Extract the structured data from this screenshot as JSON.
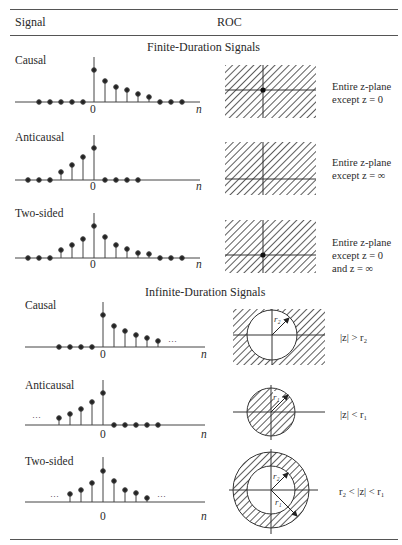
{
  "header": {
    "col_signal": "Signal",
    "col_roc": "ROC"
  },
  "sections": [
    {
      "title": "Finite-Duration Signals",
      "rows": [
        {
          "label": "Causal",
          "roc_lines": [
            "Entire z-plane",
            "except z = 0"
          ],
          "roc_type": "plane-except-origin",
          "samples": {
            "n": [
              -5,
              -4,
              -3,
              -2,
              -1,
              0,
              1,
              2,
              3,
              4,
              5,
              6,
              7,
              8
            ],
            "x": [
              0,
              0,
              0,
              0,
              0,
              1.0,
              0.67,
              0.53,
              0.41,
              0.33,
              0.24,
              0,
              0,
              0
            ]
          }
        },
        {
          "label": "Anticausal",
          "roc_lines": [
            "Entire z-plane",
            "except z = ∞"
          ],
          "roc_type": "plane-except-infinity",
          "samples": {
            "n": [
              -6,
              -5,
              -4,
              -3,
              -2,
              -1,
              0,
              1,
              2,
              3,
              4
            ],
            "x": [
              0,
              0,
              0,
              0,
              0.27,
              0.51,
              0.77,
              0,
              0,
              0,
              0
            ]
          }
        },
        {
          "label": "Two-sided",
          "roc_lines": [
            "Entire z-plane",
            "except z = 0",
            "and z = ∞"
          ],
          "roc_type": "plane-except-origin-infinity",
          "samples": {
            "n": [
              -6,
              -5,
              -4,
              -3,
              -2,
              -1,
              0,
              1,
              2,
              3,
              4,
              5,
              6,
              7,
              8
            ],
            "x": [
              0,
              0,
              0,
              0,
              0.28,
              0.45,
              0.64,
              1.0,
              0.72,
              0.47,
              0.35,
              0.19,
              0.16,
              0,
              0
            ]
          }
        }
      ]
    },
    {
      "title": "Infinite-Duration Signals",
      "rows": [
        {
          "label": "Causal",
          "roc_text": "|z| > r₂",
          "roc_type": "exterior-of-circle",
          "radius_labels": [
            "r₂"
          ],
          "ellipsis": [
            "right"
          ]
        },
        {
          "label": "Anticausal",
          "roc_text": "|z| < r₁",
          "roc_type": "interior-of-circle",
          "radius_labels": [
            "r₁"
          ],
          "ellipsis": [
            "left"
          ]
        },
        {
          "label": "Two-sided",
          "roc_text": "r₂ < |z| < r₁",
          "roc_type": "annulus",
          "radius_labels": [
            "r₂",
            "r₁"
          ],
          "ellipsis": [
            "left",
            "right"
          ]
        }
      ]
    }
  ],
  "axis": {
    "origin_label": "0",
    "n_label": "n",
    "ellipsis": "···"
  },
  "colors": {
    "ink": "#2a2a2a",
    "rule": "#555555",
    "background": "#ffffff"
  }
}
